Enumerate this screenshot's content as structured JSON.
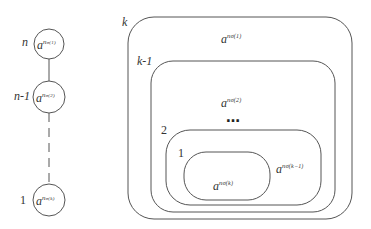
{
  "diagram": {
    "stroke_color": "#555555",
    "chain": {
      "nodes": [
        {
          "label": "n",
          "base": "a",
          "exponent": "n",
          "subscript": "σ(1)"
        },
        {
          "label": "n-1",
          "base": "a",
          "exponent": "n",
          "subscript": "σ(2)"
        },
        {
          "label": "1",
          "base": "a",
          "exponent": "n",
          "subscript": "σ(k)"
        }
      ],
      "edges": [
        {
          "from": 0,
          "to": 1,
          "style": "solid"
        },
        {
          "from": 1,
          "to": 2,
          "style": "dashed"
        }
      ]
    },
    "nested_sets": {
      "boxes": [
        {
          "label": "k",
          "term": {
            "base": "a",
            "exponent": "n",
            "subscript": "σ(1)"
          }
        },
        {
          "label": "k-1",
          "term": {
            "base": "a",
            "exponent": "n",
            "subscript": "σ(2)"
          }
        },
        {
          "label": "2",
          "term": {
            "base": "a",
            "exponent": "n",
            "subscript": "σ(k−1)"
          }
        },
        {
          "label": "1",
          "term": {
            "base": "a",
            "exponent": "n",
            "subscript": "σ(k)"
          }
        }
      ],
      "ellipsis": "…"
    }
  }
}
